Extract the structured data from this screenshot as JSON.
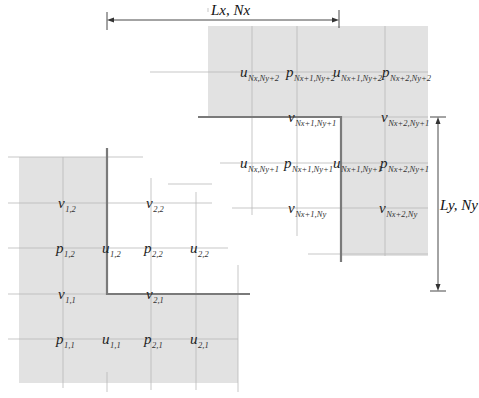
{
  "diagram": {
    "colors": {
      "ghost_fill": "#e2e2e2",
      "grid_line": "#b5b5b5",
      "boundary_line": "#7a7a7a",
      "dimension_line": "#333333",
      "text": "#222222"
    },
    "dimensions": {
      "x": {
        "label": "Lx, Nx"
      },
      "y": {
        "label": "Ly, Ny"
      }
    },
    "lower_left": {
      "labels": [
        {
          "id": "v12",
          "sym": "v",
          "sub": "1,2",
          "x": 58,
          "y": 208
        },
        {
          "id": "v22",
          "sym": "v",
          "sub": "2,2",
          "x": 146,
          "y": 208
        },
        {
          "id": "p12",
          "sym": "p",
          "sub": "1,2",
          "x": 56,
          "y": 253
        },
        {
          "id": "u12",
          "sym": "u",
          "sub": "1,2",
          "x": 102,
          "y": 253
        },
        {
          "id": "p22",
          "sym": "p",
          "sub": "2,2",
          "x": 144,
          "y": 253
        },
        {
          "id": "u22",
          "sym": "u",
          "sub": "2,2",
          "x": 190,
          "y": 253
        },
        {
          "id": "v11",
          "sym": "v",
          "sub": "1,1",
          "x": 58,
          "y": 299
        },
        {
          "id": "v21",
          "sym": "v",
          "sub": "2,1",
          "x": 146,
          "y": 299
        },
        {
          "id": "p11",
          "sym": "p",
          "sub": "1,1",
          "x": 56,
          "y": 344
        },
        {
          "id": "u11",
          "sym": "u",
          "sub": "1,1",
          "x": 102,
          "y": 344
        },
        {
          "id": "p21",
          "sym": "p",
          "sub": "2,1",
          "x": 144,
          "y": 344
        },
        {
          "id": "u21",
          "sym": "u",
          "sub": "2,1",
          "x": 190,
          "y": 344
        }
      ]
    },
    "upper_right": {
      "labels": [
        {
          "id": "uNxNy2",
          "sym": "u",
          "sub": "Nx,Ny+2",
          "x": 240,
          "y": 77
        },
        {
          "id": "pNx1Ny2",
          "sym": "p",
          "sub": "Nx+1,Ny+2",
          "x": 286,
          "y": 77
        },
        {
          "id": "uNx1Ny2",
          "sym": "u",
          "sub": "Nx+1,Ny+2",
          "x": 333,
          "y": 77
        },
        {
          "id": "pNx2Ny2",
          "sym": "p",
          "sub": "Nx+2,Ny+2",
          "x": 382,
          "y": 77
        },
        {
          "id": "vNx1Ny1",
          "sym": "v",
          "sub": "Nx+1,Ny+1",
          "x": 288,
          "y": 122
        },
        {
          "id": "vNx2Ny1",
          "sym": "v",
          "sub": "Nx+2,Ny+1",
          "x": 381,
          "y": 122
        },
        {
          "id": "uNxNy1",
          "sym": "u",
          "sub": "Nx,Ny+1",
          "x": 240,
          "y": 168
        },
        {
          "id": "pNx1Ny1",
          "sym": "p",
          "sub": "Nx+1,Ny+1",
          "x": 284,
          "y": 168
        },
        {
          "id": "uNx1Ny1",
          "sym": "u",
          "sub": "Nx+1,Ny+1",
          "x": 333,
          "y": 168
        },
        {
          "id": "pNx2Ny1",
          "sym": "p",
          "sub": "Nx+2,Ny+1",
          "x": 380,
          "y": 168
        },
        {
          "id": "vNx1Ny",
          "sym": "v",
          "sub": "Nx+1,Ny",
          "x": 288,
          "y": 213
        },
        {
          "id": "vNx2Ny",
          "sym": "v",
          "sub": "Nx+2,Ny",
          "x": 379,
          "y": 213
        }
      ]
    }
  }
}
